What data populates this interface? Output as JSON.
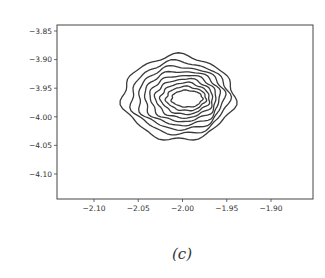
{
  "chart_data": {
    "type": "contour",
    "title": "",
    "xlabel": "",
    "ylabel": "",
    "caption": "(c)",
    "xlim": [
      -2.14,
      -1.88
    ],
    "ylim": [
      -4.14,
      -3.84
    ],
    "xticks": [
      -2.1,
      -2.05,
      -2.0,
      -1.95,
      -1.9
    ],
    "xtick_labels": [
      "−2.10",
      "−2.05",
      "−2.00",
      "−1.95",
      "−1.90"
    ],
    "yticks": [
      -3.85,
      -3.9,
      -3.95,
      -4.0,
      -4.05,
      -4.1
    ],
    "ytick_labels": [
      "−3.85",
      "−3.90",
      "−3.95",
      "−4.00",
      "−4.05",
      "−4.10"
    ],
    "grid": false,
    "legend": null,
    "contour": {
      "center": [
        -1.995,
        -3.968
      ],
      "levels": 9,
      "outer_x_extent": [
        -2.067,
        -1.942
      ],
      "outer_y_extent": [
        -4.04,
        -3.89
      ],
      "inner_x_extent": [
        -2.01,
        -1.975
      ],
      "inner_y_extent": [
        -3.985,
        -3.955
      ],
      "line_color": "#3a3a3a"
    }
  },
  "frame": {
    "left": 57,
    "top": 25,
    "right": 313,
    "bottom": 199,
    "color": "#444444"
  }
}
